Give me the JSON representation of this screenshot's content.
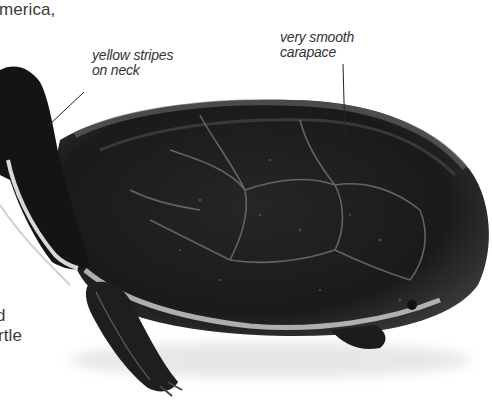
{
  "page": {
    "body_text": {
      "top_fragment": "merica,",
      "bottom_fragment_line1": "d",
      "bottom_fragment_line2": "rtle"
    },
    "figure": {
      "subject": "turtle-photo",
      "annotations": [
        {
          "id": "neck",
          "line1": "yellow stripes",
          "line2": "on neck"
        },
        {
          "id": "carapace",
          "line1": "very smooth",
          "line2": "carapace"
        }
      ]
    }
  },
  "colors": {
    "text": "#3a3a3a",
    "annotation_text": "#333333",
    "leader_line": "#222222",
    "shell_dark": "#161616",
    "shell_mid": "#2e2e2e",
    "shell_highlight": "#8a8a8a",
    "stripe_light": "#d8d8d8"
  }
}
